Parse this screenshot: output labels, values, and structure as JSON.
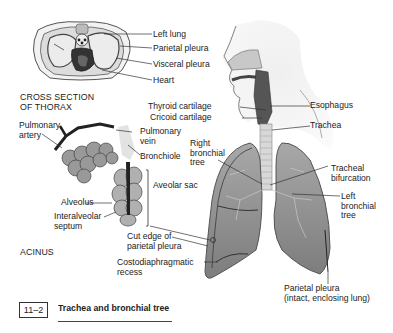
{
  "figure": {
    "number": "11–2",
    "title": "Trachea and bronchial tree"
  },
  "cross_section": {
    "caption_line1": "CROSS SECTION",
    "caption_line2": "OF THORAX",
    "labels": {
      "left_lung": "Left lung",
      "parietal_pleura": "Parietal pleura",
      "visceral_pleura": "Visceral pleura",
      "heart": "Heart"
    }
  },
  "acinus": {
    "caption": "ACINUS",
    "labels": {
      "pulmonary_artery_1": "Pulmonary",
      "pulmonary_artery_2": "artery",
      "pulmonary_vein_1": "Pulmonary",
      "pulmonary_vein_2": "vein",
      "bronchiole": "Bronchiole",
      "aveolar_sac": "Aveolar sac",
      "alveolus": "Alveolus",
      "interalveolar_septum_1": "Interalveolar",
      "interalveolar_septum_2": "septum"
    }
  },
  "respiratory_tract": {
    "labels": {
      "thyroid_cartilage": "Thyroid cartilage",
      "cricoid_cartilage": "Cricoid cartilage",
      "esophagus": "Esophagus",
      "trachea": "Trachea",
      "right_bronchial_tree_1": "Right",
      "right_bronchial_tree_2": "bronchial",
      "right_bronchial_tree_3": "tree",
      "tracheal_bifurcation_1": "Tracheal",
      "tracheal_bifurcation_2": "bifurcation",
      "left_bronchial_tree_1": "Left",
      "left_bronchial_tree_2": "bronchial",
      "left_bronchial_tree_3": "tree",
      "cut_edge_1": "Cut edge of",
      "cut_edge_2": "parietal pleura",
      "costodiaphragmatic_1": "Costodiaphragmatic",
      "costodiaphragmatic_2": "recess",
      "parietal_pleura_intact_1": "Parietal pleura",
      "parietal_pleura_intact_2": "(intact, enclosing lung)"
    }
  },
  "colors": {
    "lung_fill": "#8e8e8e",
    "tissue_light": "#e6e6e6",
    "line": "#333333"
  }
}
